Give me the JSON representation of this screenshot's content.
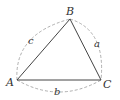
{
  "diagram": {
    "vertices": {
      "A": {
        "label": "A",
        "x": 17,
        "y": 80
      },
      "B": {
        "label": "B",
        "x": 70,
        "y": 19
      },
      "C": {
        "label": "C",
        "x": 101,
        "y": 80
      }
    },
    "sides": {
      "a": {
        "label": "a",
        "between": [
          "B",
          "C"
        ]
      },
      "b": {
        "label": "b",
        "between": [
          "A",
          "C"
        ]
      },
      "c": {
        "label": "c",
        "between": [
          "A",
          "B"
        ]
      }
    },
    "colors": {
      "edge": "#444444",
      "arc": "#999999",
      "text": "#333333"
    }
  }
}
